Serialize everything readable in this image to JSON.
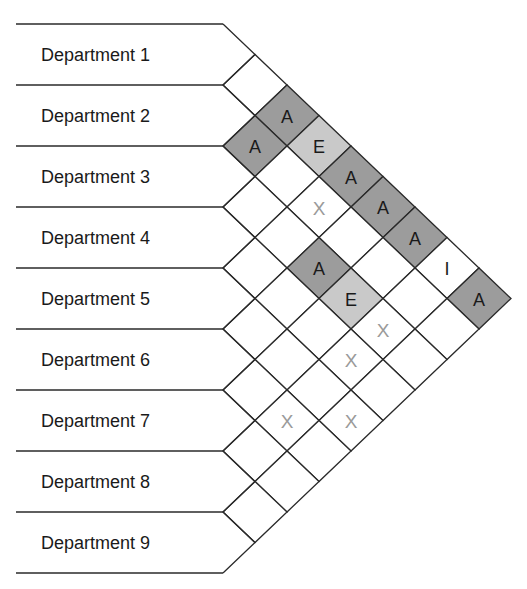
{
  "diagram": {
    "title": "",
    "type": "activity-relationship-chart",
    "departments": [
      "Department 1",
      "Department 2",
      "Department 3",
      "Department 4",
      "Department 5",
      "Department 6",
      "Department 7",
      "Department 8",
      "Department 9"
    ],
    "codes": {
      "A": {
        "fill": "#9c9c9c",
        "text_color": "#1a1a1a"
      },
      "E": {
        "fill": "#c9c9c9",
        "text_color": "#1a1a1a"
      },
      "I": {
        "fill": "#ffffff",
        "text_color": "#1a1a1a"
      },
      "X": {
        "fill": "#ffffff",
        "text_color": "#9a9a9a"
      },
      "": {
        "fill": "#ffffff",
        "text_color": "#1a1a1a"
      }
    },
    "relationships": [
      {
        "from": 1,
        "to": 2,
        "code": ""
      },
      {
        "from": 1,
        "to": 3,
        "code": "A"
      },
      {
        "from": 1,
        "to": 4,
        "code": "E"
      },
      {
        "from": 1,
        "to": 5,
        "code": "A"
      },
      {
        "from": 1,
        "to": 6,
        "code": "A"
      },
      {
        "from": 1,
        "to": 7,
        "code": "A"
      },
      {
        "from": 1,
        "to": 8,
        "code": "I"
      },
      {
        "from": 1,
        "to": 9,
        "code": "A"
      },
      {
        "from": 2,
        "to": 3,
        "code": "A"
      },
      {
        "from": 2,
        "to": 4,
        "code": ""
      },
      {
        "from": 2,
        "to": 5,
        "code": "X"
      },
      {
        "from": 2,
        "to": 6,
        "code": ""
      },
      {
        "from": 2,
        "to": 7,
        "code": ""
      },
      {
        "from": 2,
        "to": 8,
        "code": ""
      },
      {
        "from": 2,
        "to": 9,
        "code": ""
      },
      {
        "from": 3,
        "to": 4,
        "code": ""
      },
      {
        "from": 3,
        "to": 5,
        "code": ""
      },
      {
        "from": 3,
        "to": 6,
        "code": "A"
      },
      {
        "from": 3,
        "to": 7,
        "code": "E"
      },
      {
        "from": 3,
        "to": 8,
        "code": "X"
      },
      {
        "from": 3,
        "to": 9,
        "code": ""
      },
      {
        "from": 4,
        "to": 5,
        "code": ""
      },
      {
        "from": 4,
        "to": 6,
        "code": ""
      },
      {
        "from": 4,
        "to": 7,
        "code": ""
      },
      {
        "from": 4,
        "to": 8,
        "code": "X"
      },
      {
        "from": 4,
        "to": 9,
        "code": ""
      },
      {
        "from": 5,
        "to": 6,
        "code": ""
      },
      {
        "from": 5,
        "to": 7,
        "code": ""
      },
      {
        "from": 5,
        "to": 8,
        "code": ""
      },
      {
        "from": 5,
        "to": 9,
        "code": "X"
      },
      {
        "from": 6,
        "to": 7,
        "code": ""
      },
      {
        "from": 6,
        "to": 8,
        "code": "X"
      },
      {
        "from": 6,
        "to": 9,
        "code": ""
      },
      {
        "from": 7,
        "to": 8,
        "code": ""
      },
      {
        "from": 7,
        "to": 9,
        "code": ""
      },
      {
        "from": 8,
        "to": 9,
        "code": ""
      }
    ],
    "geometry": {
      "left_x": 16,
      "line_end_x": 223,
      "top_y": 24,
      "row_height": 61,
      "cell_half_width": 32,
      "label_x": 41
    }
  }
}
